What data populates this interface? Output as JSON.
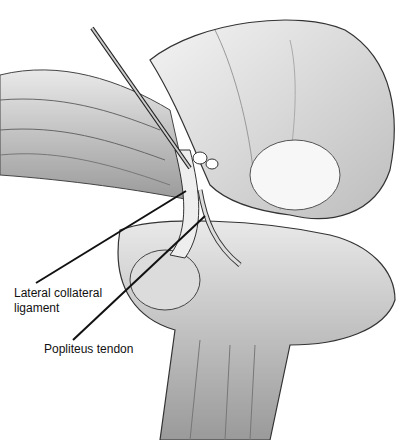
{
  "figure": {
    "labels": [
      {
        "id": "lcl",
        "line1": "Lateral collateral",
        "line2": "ligament"
      },
      {
        "id": "popliteus",
        "line1": "Popliteus tendon"
      }
    ]
  }
}
